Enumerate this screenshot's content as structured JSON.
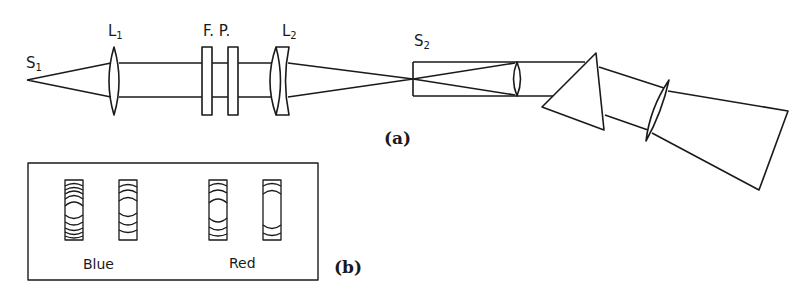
{
  "diagram": {
    "type": "optical setup: Fabry-Perot interferometer with prism spectrograph",
    "labels": {
      "s1": {
        "main": "S",
        "sub": "1"
      },
      "l1": {
        "main": "L",
        "sub": "1"
      },
      "fp": "F. P.",
      "l2": {
        "main": "L",
        "sub": "2"
      },
      "s2": {
        "main": "S",
        "sub": "2"
      }
    },
    "captions": {
      "a": "(a)",
      "b": "(b)"
    },
    "fringes": {
      "blue_label": "Blue",
      "red_label": "Red"
    },
    "components": [
      "S1 source",
      "lens L1",
      "Fabry-Perot etalon (two plates)",
      "lens L2",
      "slit S2",
      "collimator lens",
      "prism",
      "camera lens",
      "focal plane"
    ],
    "stroke_color": "#1a1a1a",
    "background": "#ffffff"
  }
}
